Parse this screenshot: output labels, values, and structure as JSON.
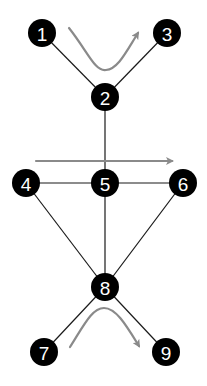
{
  "diagram": {
    "type": "graph",
    "nodes": [
      {
        "id": "1",
        "label": "1",
        "x": 42,
        "y": 33
      },
      {
        "id": "2",
        "label": "2",
        "x": 105,
        "y": 97
      },
      {
        "id": "3",
        "label": "3",
        "x": 167,
        "y": 33
      },
      {
        "id": "4",
        "label": "4",
        "x": 26,
        "y": 183
      },
      {
        "id": "5",
        "label": "5",
        "x": 105,
        "y": 183
      },
      {
        "id": "6",
        "label": "6",
        "x": 183,
        "y": 183
      },
      {
        "id": "7",
        "label": "7",
        "x": 44,
        "y": 352
      },
      {
        "id": "8",
        "label": "8",
        "x": 105,
        "y": 287
      },
      {
        "id": "9",
        "label": "9",
        "x": 166,
        "y": 352
      }
    ],
    "edges": [
      [
        "1",
        "2"
      ],
      [
        "3",
        "2"
      ],
      [
        "2",
        "5"
      ],
      [
        "4",
        "5"
      ],
      [
        "5",
        "6"
      ],
      [
        "4",
        "8"
      ],
      [
        "5",
        "8"
      ],
      [
        "6",
        "8"
      ],
      [
        "8",
        "7"
      ],
      [
        "8",
        "9"
      ]
    ],
    "arrows": [
      {
        "description": "curved arrow from near node 1 dipping down and up toward node 3"
      },
      {
        "description": "straight horizontal arrow passing above nodes 4-5-6 pointing right"
      },
      {
        "description": "curved arrow from near node 7 arching up and down toward node 9"
      }
    ],
    "colors": {
      "node_fill": "#000000",
      "node_text": "#ffffff",
      "edge": "#1a1a1a",
      "arrow": "#8a8a8a"
    }
  }
}
